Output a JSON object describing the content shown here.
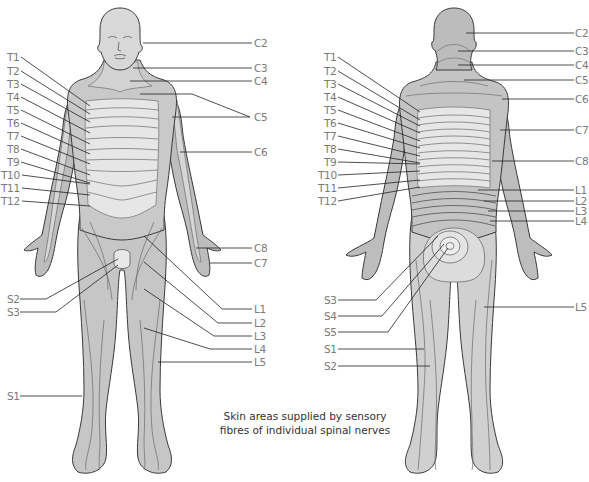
{
  "caption": {
    "line1": "Skin areas supplied by sensory",
    "line2": "fibres of individual spinal nerves"
  },
  "colors": {
    "outline": "#3a3a3a",
    "skin_dark": "#b9b9b9",
    "skin_mid": "#cdcdcd",
    "skin_light": "#e4e4e4",
    "leader": "#222222",
    "label": "#7a7a7a",
    "background": "#ffffff"
  },
  "front_view": {
    "left_labels": [
      "T1",
      "T2",
      "T3",
      "T4",
      "T5",
      "T6",
      "T7",
      "T8",
      "T9",
      "T10",
      "T11",
      "T12",
      "S2",
      "S3",
      "S1"
    ],
    "right_labels": [
      "C2",
      "C3",
      "C4",
      "C5",
      "C6",
      "C8",
      "C7",
      "L1",
      "L2",
      "L3",
      "L4",
      "L5"
    ]
  },
  "back_view": {
    "left_labels": [
      "T1",
      "T2",
      "T3",
      "T4",
      "T5",
      "T6",
      "T7",
      "T8",
      "T9",
      "T10",
      "T11",
      "T12",
      "S3",
      "S4",
      "S5",
      "S1",
      "S2"
    ],
    "right_labels": [
      "C2",
      "C3",
      "C4",
      "C5",
      "C6",
      "C7",
      "C8",
      "L1",
      "L2",
      "L3",
      "L4",
      "L5"
    ]
  },
  "labels": {
    "f_T1": "T1",
    "f_T2": "T2",
    "f_T3": "T3",
    "f_T4": "T4",
    "f_T5": "T5",
    "f_T6": "T6",
    "f_T7": "T7",
    "f_T8": "T8",
    "f_T9": "T9",
    "f_T10": "T10",
    "f_T11": "T11",
    "f_T12": "T12",
    "f_S2": "S2",
    "f_S3": "S3",
    "f_S1": "S1",
    "f_C2": "C2",
    "f_C3": "C3",
    "f_C4": "C4",
    "f_C5": "C5",
    "f_C6": "C6",
    "f_C8": "C8",
    "f_C7": "C7",
    "f_L1": "L1",
    "f_L2": "L2",
    "f_L3": "L3",
    "f_L4": "L4",
    "f_L5": "L5",
    "b_T1": "T1",
    "b_T2": "T2",
    "b_T3": "T3",
    "b_T4": "T4",
    "b_T5": "T5",
    "b_T6": "T6",
    "b_T7": "T7",
    "b_T8": "T8",
    "b_T9": "T9",
    "b_T10": "T10",
    "b_T11": "T11",
    "b_T12": "T12",
    "b_S3": "S3",
    "b_S4": "S4",
    "b_S5": "S5",
    "b_S1": "S1",
    "b_S2": "S2",
    "b_C2": "C2",
    "b_C3": "C3",
    "b_C4": "C4",
    "b_C5": "C5",
    "b_C6": "C6",
    "b_C7": "C7",
    "b_C8": "C8",
    "b_L1": "L1",
    "b_L2": "L2",
    "b_L3": "L3",
    "b_L4": "L4",
    "b_L5": "L5"
  }
}
